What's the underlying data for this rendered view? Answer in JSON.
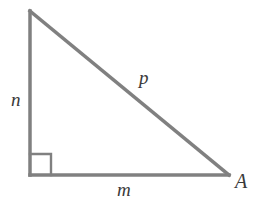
{
  "figure": {
    "type": "right-triangle",
    "background_color": "#ffffff",
    "stroke_color": "#808080",
    "stroke_width": 3.5,
    "label_color": "#3a3a3a",
    "canvas": {
      "width": 265,
      "height": 210
    },
    "vertices": {
      "apex": {
        "x": 30,
        "y": 11,
        "label": ""
      },
      "right_angle": {
        "x": 30,
        "y": 175,
        "label": ""
      },
      "lower_right": {
        "x": 229,
        "y": 175,
        "label": "A"
      }
    },
    "right_angle_marker": {
      "present": true,
      "size": 21,
      "corner_x": 30,
      "corner_y": 175
    },
    "labels": {
      "vertical_leg": "n",
      "hypotenuse": "p",
      "horizontal_leg": "m",
      "vertex": "A"
    }
  }
}
